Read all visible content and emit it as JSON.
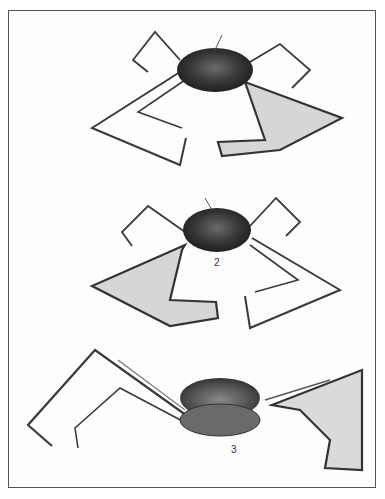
{
  "plate": {
    "figures": [
      {
        "id": "figure-1",
        "label": ""
      },
      {
        "id": "figure-2",
        "label": "2"
      },
      {
        "id": "figure-3",
        "label": "3"
      }
    ]
  },
  "colors": {
    "border": "#555555",
    "leg_stroke": "#3a3a3a",
    "membrane_fill": "#d8d8d8",
    "body_dark": "#2a2a2a",
    "body_mid": "#555555",
    "background": "#fdfdfd"
  }
}
